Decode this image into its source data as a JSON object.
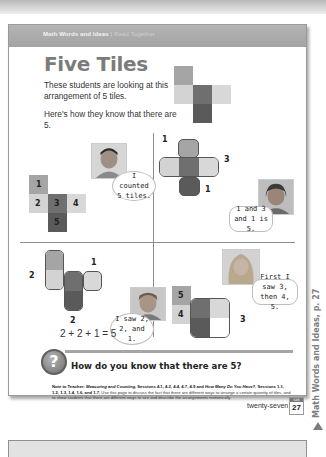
{
  "header": {
    "section": "Math Words and Ideas",
    "separator": "|",
    "subsection": "Read Together"
  },
  "title": "Five Tiles",
  "intro": [
    "These students are looking at this arrangement of 5 tiles.",
    "Here's how they know that there are 5."
  ],
  "colors": {
    "tile_light": "#d3d3d3",
    "tile_mid": "#a5a5a5",
    "tile_dark": "#6f6f6f",
    "tile_darker": "#5a5a5a",
    "header_bg": "#a9a9a9",
    "title_gray": "#7b7b7b"
  },
  "panels": [
    {
      "id": "counted",
      "tile_labels": [
        "1",
        "2",
        "3",
        "4",
        "5"
      ],
      "speech": "I counted 5 tiles."
    },
    {
      "id": "one-three-one",
      "group_labels": [
        "1",
        "3",
        "1"
      ],
      "speech": "1 and 3 and 1 is 5."
    },
    {
      "id": "two-two-one",
      "group_labels": [
        "2",
        "1",
        "2"
      ],
      "speech": "I saw 2, 2, and 1.",
      "equation": "2 + 2 + 1 = 5"
    },
    {
      "id": "three-four-five",
      "group_labels": [
        "5",
        "4",
        "3"
      ],
      "speech": "First I saw 3, then 4, 5."
    }
  ],
  "question": {
    "icon": "question-mark-icon",
    "icon_glyph": "?",
    "text": "How do you know that there are 5?"
  },
  "note": {
    "label": "Note to Teacher:",
    "units1": "Measuring and Counting,",
    "sessions1": "Sessions 4.1, 4.2, 4.4, 4.7, 4.9",
    "and": "and",
    "units2": "How Many Do You Have?,",
    "sessions2": "Sessions 1.1, 1.2, 1.3, 1.4, 1.6, and 1.7.",
    "body": "Use this page to discuss the fact that there are different ways to arrange a certain quantity of tiles, and to show students that there are different ways to see and describe the arrangements numerically."
  },
  "footer": {
    "page_word": "twenty-seven",
    "badge_label": "SAB",
    "page_number": "27"
  },
  "side_tab": {
    "text": "Math Words and Ideas, p. 27",
    "arrow": "triangle-up-icon"
  }
}
